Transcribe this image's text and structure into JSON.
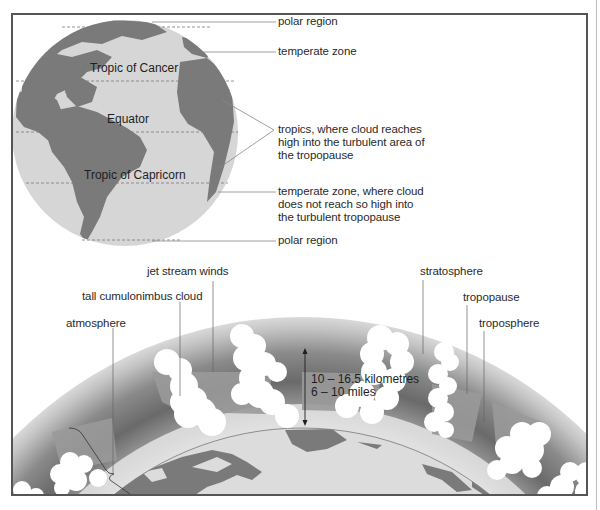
{
  "globe": {
    "latitude_labels": {
      "cancer": "Tropic of Cancer",
      "equator": "Equator",
      "capricorn": "Tropic of Capricorn"
    },
    "callouts": {
      "polar_north": "polar region",
      "temperate_north": "temperate zone",
      "tropics": "tropics, where cloud reaches high into the turbulent area of the tropopause",
      "temperate_south": "temperate zone, where cloud does not reach so high into the turbulent tropopause",
      "polar_south": "polar region"
    }
  },
  "cross_section": {
    "labels": {
      "jet_stream": "jet stream winds",
      "cumulonimbus": "tall cumulonimbus cloud",
      "atmosphere": "atmosphere",
      "stratosphere": "stratosphere",
      "tropopause": "tropopause",
      "troposphere": "troposphere"
    },
    "measurement": {
      "km": "10 – 16.5 kilometres",
      "miles": "6 – 10 miles"
    }
  },
  "colors": {
    "ocean": "#d6d6d6",
    "land": "#7a7a7a",
    "stratosphere_band": "#6e6e6e",
    "troposphere_band": "#9a9a9a",
    "cloud": "#ffffff",
    "frame": "#555555"
  }
}
